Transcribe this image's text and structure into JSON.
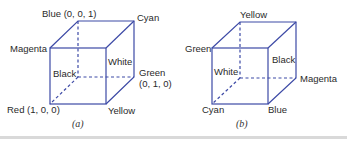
{
  "figure_a": {
    "caption": "(a)",
    "labels": {
      "blue": "Blue (0, 0, 1)",
      "cyan": "Cyan",
      "magenta": "Magenta",
      "white": "White",
      "black": "Black",
      "green": "Green",
      "green_coord": "(0, 1, 0)",
      "red": "Red (1, 0, 0)",
      "yellow": "Yellow"
    }
  },
  "figure_b": {
    "caption": "(b)",
    "labels": {
      "yellow": "Yellow",
      "green": "Green",
      "black": "Black",
      "white": "White",
      "magenta": "Magenta",
      "cyan": "Cyan",
      "blue": "Blue"
    }
  },
  "colors": {
    "cube_line": "#3d4aa6"
  }
}
